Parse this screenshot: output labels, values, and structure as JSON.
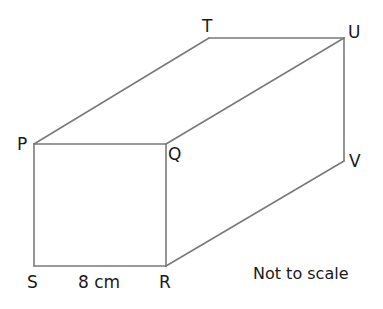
{
  "diagram": {
    "type": "cuboid",
    "vertices": {
      "P": {
        "label": "P",
        "x": 34,
        "y": 144
      },
      "Q": {
        "label": "Q",
        "x": 166,
        "y": 144
      },
      "R": {
        "label": "R",
        "x": 166,
        "y": 266
      },
      "S": {
        "label": "S",
        "x": 34,
        "y": 266
      },
      "T": {
        "label": "T",
        "x": 209,
        "y": 38
      },
      "U": {
        "label": "U",
        "x": 344,
        "y": 38
      },
      "V": {
        "label": "V",
        "x": 344,
        "y": 161
      }
    },
    "edges": [
      [
        "P",
        "Q"
      ],
      [
        "Q",
        "R"
      ],
      [
        "R",
        "S"
      ],
      [
        "S",
        "P"
      ],
      [
        "P",
        "T"
      ],
      [
        "T",
        "U"
      ],
      [
        "Q",
        "U"
      ],
      [
        "U",
        "V"
      ],
      [
        "R",
        "V"
      ]
    ],
    "dimension_label": "8 cm",
    "dimension_edge": [
      "S",
      "R"
    ],
    "note": "Not to scale",
    "colors": {
      "edge": "#7a7a7a",
      "text": "#1a1a1a",
      "background": "#ffffff"
    }
  }
}
